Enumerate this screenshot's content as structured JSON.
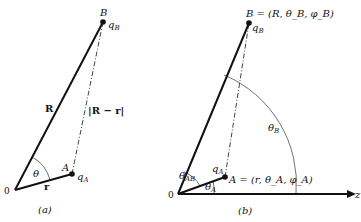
{
  "figure_a": {
    "caption": "(a)",
    "origin_label": "0",
    "point_A_label": "A",
    "point_B_label": "B",
    "charge_A": "q",
    "charge_A_sub": "A",
    "charge_B": "q",
    "charge_B_sub": "B",
    "vector_R_label": "R",
    "vector_r_label": "r",
    "distance_label": "|R − r|",
    "angle_label": "θ"
  },
  "figure_b": {
    "caption": "(b)",
    "origin_label": "0",
    "axis_label": "z",
    "point_B_label": "B = (R, θ",
    "point_B_coords": "B = (R, θ_B, φ_B)",
    "point_A_coords": "A = (r, θ_A, φ_A)",
    "charge_A": "q",
    "charge_A_sub": "A",
    "charge_B": "q",
    "charge_B_sub": "B",
    "angle_AB": "θ",
    "angle_AB_sub": "AB",
    "angle_A": "θ",
    "angle_A_sub": "A",
    "angle_B": "θ",
    "angle_B_sub": "B"
  }
}
